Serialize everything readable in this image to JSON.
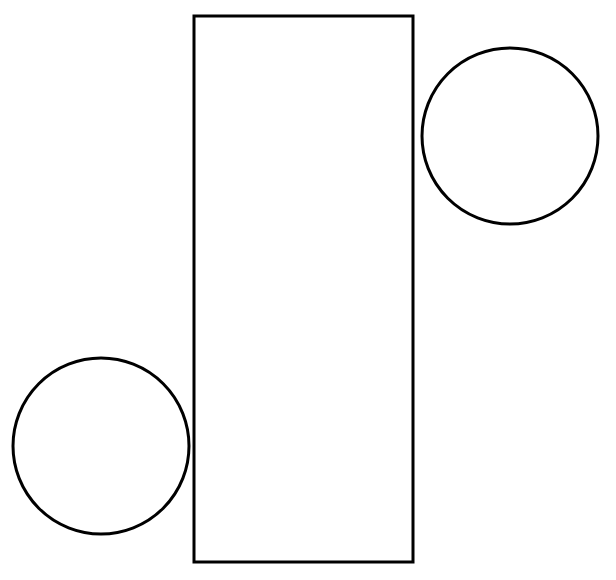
{
  "canvas": {
    "width": 616,
    "height": 580,
    "background_color": "#ffffff",
    "title": "Overlapping geometric shapes"
  },
  "style": {
    "stroke_color": "#000000",
    "stroke_width": 3,
    "fill_color": "#ffffff",
    "fill": "none"
  },
  "shapes": [
    {
      "id": "rectangle-1",
      "type": "rectangle",
      "label": "Rectangle",
      "x": 194,
      "y": 16,
      "width": 219,
      "height": 546,
      "stroke_color": "#000000",
      "stroke_width": 3,
      "fill": "none"
    },
    {
      "id": "circle-top-right",
      "type": "circle",
      "label": "Circle (upper right)",
      "cx": 510,
      "cy": 136,
      "r": 88,
      "stroke_color": "#000000",
      "stroke_width": 3,
      "fill": "none"
    },
    {
      "id": "circle-bottom-left",
      "type": "circle",
      "label": "Circle (lower left)",
      "cx": 101,
      "cy": 446,
      "r": 88,
      "stroke_color": "#000000",
      "stroke_width": 3,
      "fill": "none"
    }
  ]
}
